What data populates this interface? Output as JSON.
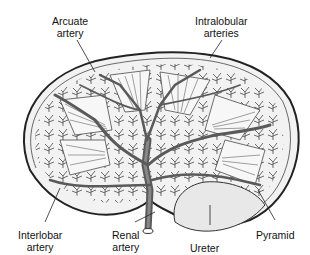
{
  "diagram": {
    "labels": {
      "arcuate_artery": {
        "line1": "Arcuate",
        "line2": "artery"
      },
      "intralobular_arteries": {
        "line1": "Intralobular",
        "line2": "arteries"
      },
      "interlobar_artery": {
        "line1": "Interlobar",
        "line2": "artery"
      },
      "renal_artery": {
        "line1": "Renal",
        "line2": "artery"
      },
      "ureter": {
        "line1": "Ureter"
      },
      "pyramid": {
        "line1": "Pyramid"
      }
    },
    "colors": {
      "outline": "#222222",
      "vessel": "#555555",
      "cortex_fill": "#eeeeee",
      "pelvis_fill": "#e4e4e4",
      "background": "#ffffff"
    }
  }
}
